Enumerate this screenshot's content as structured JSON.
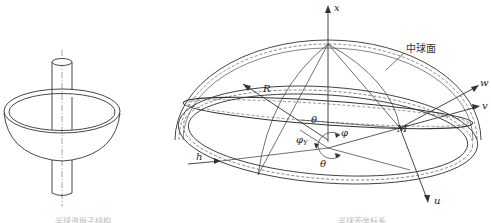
{
  "figures": [
    {
      "id": "left",
      "description": "Hemispherical resonator with central stem (3D perspective)",
      "caption": "半球谐振子结构"
    },
    {
      "id": "right",
      "description": "Coordinate system of hemispherical shell middle surface",
      "caption": "半球壳坐标系",
      "labels": {
        "x_axis": "x",
        "mid_surface": "中球面",
        "w_axis": "w",
        "v_axis": "v",
        "u_axis": "u",
        "radius": "R",
        "point_m": "M",
        "theta_top": "θ",
        "theta_bottom": "θ",
        "phi": "φ",
        "phi_y_base": "φ",
        "phi_y_sub": "Y",
        "h": "h"
      }
    }
  ],
  "colors": {
    "line": "#333333",
    "dashed": "#555555",
    "background": "#ffffff"
  }
}
